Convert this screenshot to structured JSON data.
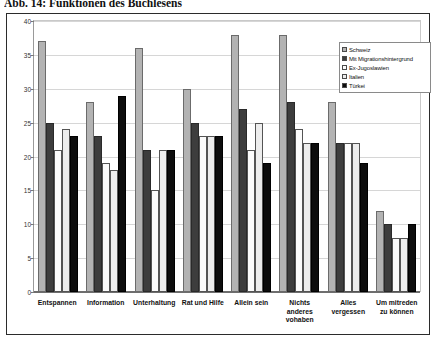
{
  "figure": {
    "title": "Abb. 14: Funktionen des Buchlesens"
  },
  "legend": {
    "position": "top-right",
    "entries": [
      {
        "label": "Schweiz",
        "color": "#b3b3b3"
      },
      {
        "label": "Mit Migrationshintergrund",
        "color": "#3d3d3d"
      },
      {
        "label": "Ex-Jugoslawien",
        "color": "#fbfbfb"
      },
      {
        "label": "Italien",
        "color": "#ededed"
      },
      {
        "label": "Türkei",
        "color": "#0d0d0d"
      }
    ]
  },
  "chart_data": {
    "type": "bar",
    "title": "Abb. 14: Funktionen des Buchlesens",
    "xlabel": "",
    "ylabel": "",
    "ylim": [
      0,
      40
    ],
    "yticks": [
      0,
      5,
      10,
      15,
      20,
      25,
      30,
      35,
      40
    ],
    "ytick_labels": [
      "0",
      "5",
      "10",
      "15",
      "20",
      "25",
      "30",
      "35",
      "40"
    ],
    "grid": true,
    "legend_position": "top-right",
    "categories": [
      "Entspannen",
      "Information",
      "Unterhaltung",
      "Rat und Hilfe",
      "Allein sein",
      "Nichts anderes vohaben",
      "Alles vergessen",
      "Um mitreden zu können"
    ],
    "series": [
      {
        "name": "Schweiz",
        "color": "#b3b3b3",
        "values": [
          37,
          28,
          36,
          30,
          38,
          38,
          28,
          12
        ]
      },
      {
        "name": "Mit Migrationshintergrund",
        "color": "#3d3d3d",
        "values": [
          25,
          23,
          21,
          25,
          27,
          28,
          22,
          10
        ]
      },
      {
        "name": "Ex-Jugoslawien",
        "color": "#fbfbfb",
        "values": [
          21,
          19,
          15,
          23,
          21,
          24,
          22,
          8
        ]
      },
      {
        "name": "Italien",
        "color": "#ededed",
        "values": [
          24,
          18,
          21,
          23,
          25,
          22,
          22,
          8
        ]
      },
      {
        "name": "Türkei",
        "color": "#0d0d0d",
        "values": [
          23,
          29,
          21,
          23,
          19,
          22,
          19,
          10
        ]
      }
    ]
  }
}
